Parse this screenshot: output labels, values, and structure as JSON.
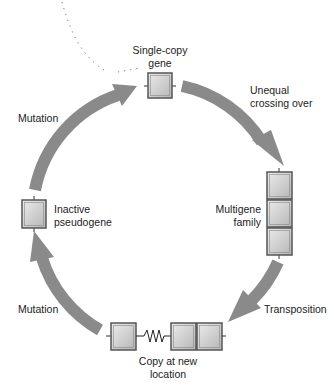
{
  "diagram": {
    "type": "cycle",
    "colors": {
      "arrow": "#8a8a8a",
      "box_fill_light": "#e8e8e8",
      "box_fill_dark": "#b9b9b9",
      "box_border": "#555555",
      "dotted_line": "#777777"
    },
    "nodes": {
      "single_copy": {
        "label_line1": "Single-copy",
        "label_line2": "gene"
      },
      "multigene": {
        "label_line1": "Multigene",
        "label_line2": "family"
      },
      "copy_new_location": {
        "label_line1": "Copy at new",
        "label_line2": "location"
      },
      "pseudogene": {
        "label_line1": "Inactive",
        "label_line2": "pseudogene"
      }
    },
    "edges": {
      "unequal_crossing": {
        "label_line1": "Unequal",
        "label_line2": "crossing over"
      },
      "transposition": {
        "label": "Transposition"
      },
      "mutation_bottom": {
        "label": "Mutation"
      },
      "mutation_top": {
        "label": "Mutation"
      }
    }
  }
}
